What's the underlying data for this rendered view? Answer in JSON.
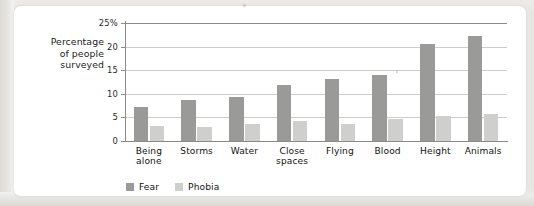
{
  "chart_data": {
    "type": "bar",
    "title": "",
    "xlabel": "",
    "ylabel": "Percentage of people surveyed",
    "ylim": [
      0,
      25
    ],
    "yticks": [
      "0",
      "5",
      "10",
      "15",
      "20",
      "25%"
    ],
    "grid": true,
    "legend_position": "bottom-left",
    "categories": [
      "Being alone",
      "Storms",
      "Water",
      "Close spaces",
      "Flying",
      "Blood",
      "Height",
      "Animals"
    ],
    "category_lines": [
      [
        "Being",
        "alone"
      ],
      [
        "Storms"
      ],
      [
        "Water"
      ],
      [
        "Close",
        "spaces"
      ],
      [
        "Flying"
      ],
      [
        "Blood"
      ],
      [
        "Height"
      ],
      [
        "Animals"
      ]
    ],
    "series": [
      {
        "name": "Fear",
        "color": "#9a9a98",
        "values": [
          7.2,
          8.7,
          9.4,
          11.9,
          13.2,
          14.0,
          20.5,
          22.2
        ]
      },
      {
        "name": "Phobia",
        "color": "#cfcfcd",
        "values": [
          3.1,
          3.0,
          3.5,
          4.3,
          3.6,
          4.6,
          5.4,
          5.8
        ]
      }
    ]
  },
  "axis": {
    "y_caption_lines": [
      "Percentage",
      "of people",
      "surveyed"
    ]
  },
  "legend": {
    "items": [
      {
        "label": "Fear",
        "color": "#9a9a98"
      },
      {
        "label": "Phobia",
        "color": "#cfcfcd"
      }
    ]
  },
  "colors": {
    "fear": "#9a9a98",
    "phobia": "#cfcfcd",
    "gridline": "#cfcdc9",
    "axis": "#8d8a86",
    "card": "#ffffff",
    "page_background": "#eceae7"
  }
}
